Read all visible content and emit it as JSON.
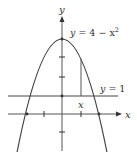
{
  "figure": {
    "type": "graph",
    "axes": {
      "x_label": "x",
      "y_label": "y"
    },
    "curve": {
      "label_lhs": "y",
      "label_eq": " = 4 − x",
      "label_exp": "2",
      "equation": "y = 4 - x^2"
    },
    "line": {
      "label_lhs": "y",
      "label_rest": " = 1",
      "equation": "y = 1"
    },
    "segment": {
      "label": "x"
    },
    "y_ticks": [
      -1,
      1,
      2,
      3,
      4
    ],
    "x_ticks": [
      -2,
      -1,
      1,
      2
    ],
    "colors": {
      "stroke": "#333333",
      "background": "#ffffff"
    }
  }
}
